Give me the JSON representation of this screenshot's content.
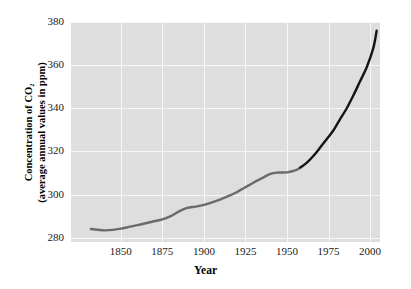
{
  "chart_data": {
    "type": "line",
    "title": "",
    "xlabel": "Year",
    "ylabel_line1": "Concentration of CO₂",
    "ylabel_line2": "(average annual values in ppm)",
    "xlim": [
      1820,
      2006
    ],
    "ylim": [
      278,
      380
    ],
    "grid": true,
    "legend": "none",
    "plot_background": "#dedede",
    "gridline_color": "#f7f7f7",
    "page_background": "#ffffff",
    "xticks": [
      1850,
      1875,
      1900,
      1925,
      1950,
      1975,
      2000
    ],
    "xtick_labels": [
      "1850",
      "1875",
      "1900",
      "1925",
      "1950",
      "1975",
      "2000"
    ],
    "yticks": [
      280,
      300,
      320,
      340,
      360,
      380
    ],
    "ytick_labels": [
      "280",
      "300",
      "320",
      "340",
      "360",
      "380"
    ],
    "series": [
      {
        "name": "ice-core record",
        "color": "#6b6b6b",
        "width": 2.4,
        "x": [
          1832,
          1836,
          1840,
          1845,
          1850,
          1855,
          1860,
          1865,
          1870,
          1875,
          1880,
          1885,
          1890,
          1895,
          1900,
          1905,
          1910,
          1915,
          1920,
          1925,
          1930,
          1935,
          1940,
          1945,
          1950,
          1955,
          1958
        ],
        "y": [
          284.0,
          283.7,
          283.4,
          283.6,
          284.2,
          285.0,
          285.8,
          286.7,
          287.6,
          288.5,
          290.0,
          292.2,
          293.8,
          294.4,
          295.2,
          296.4,
          297.8,
          299.4,
          301.2,
          303.4,
          305.6,
          307.6,
          309.6,
          310.2,
          310.3,
          311.2,
          312.5
        ]
      },
      {
        "name": "direct atmospheric measurements",
        "color": "#151515",
        "width": 2.4,
        "x": [
          1958,
          1962,
          1966,
          1970,
          1974,
          1978,
          1982,
          1986,
          1990,
          1994,
          1998,
          2002,
          2004
        ],
        "y": [
          312.5,
          314.8,
          318.0,
          321.8,
          325.8,
          329.8,
          335.0,
          340.0,
          346.0,
          352.5,
          359.0,
          368.0,
          376.0
        ]
      }
    ],
    "annotations": []
  }
}
